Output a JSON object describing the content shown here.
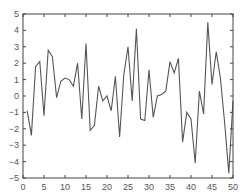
{
  "chart_data": {
    "type": "line",
    "title": "",
    "xlabel": "",
    "ylabel": "",
    "xlim": [
      0,
      50
    ],
    "ylim": [
      -5,
      5
    ],
    "grid": false,
    "legend": null,
    "x_ticks": [
      0,
      5,
      10,
      15,
      20,
      25,
      30,
      35,
      40,
      45,
      50
    ],
    "y_ticks": [
      -5,
      -4,
      -3,
      -2,
      -1,
      0,
      1,
      2,
      3,
      4,
      5
    ],
    "x_tick_labels": [
      "0",
      "5",
      "10",
      "15",
      "20",
      "25",
      "30",
      "35",
      "40",
      "45",
      "50"
    ],
    "y_tick_labels": [
      "−5",
      "−4",
      "−3",
      "−2",
      "−1",
      "0",
      "1",
      "2",
      "3",
      "4",
      "5"
    ],
    "series": [
      {
        "name": "series-1",
        "color": "#555555",
        "x": [
          1,
          2,
          3,
          4,
          5,
          6,
          7,
          8,
          9,
          10,
          11,
          12,
          13,
          14,
          15,
          16,
          17,
          18,
          19,
          20,
          21,
          22,
          23,
          24,
          25,
          26,
          27,
          28,
          29,
          30,
          31,
          32,
          33,
          34,
          35,
          36,
          37,
          38,
          39,
          40,
          41,
          42,
          43,
          44,
          45,
          46,
          47,
          48,
          49,
          50
        ],
        "values": [
          -0.9,
          -2.4,
          1.8,
          2.1,
          -1.2,
          2.8,
          2.4,
          -0.1,
          0.9,
          1.1,
          1.0,
          0.6,
          2.0,
          -1.4,
          3.2,
          -2.1,
          -1.8,
          0.6,
          -0.3,
          0.0,
          -0.9,
          1.2,
          -2.5,
          1.3,
          3.0,
          -0.3,
          4.1,
          -1.4,
          -1.5,
          1.6,
          -1.3,
          0.0,
          0.1,
          0.3,
          2.1,
          1.4,
          2.3,
          -2.8,
          -1.0,
          -1.4,
          -4.1,
          0.3,
          -1.1,
          4.5,
          0.7,
          2.7,
          1.1,
          -1.6,
          -4.7,
          -0.3
        ]
      }
    ]
  },
  "style": {
    "axis_color": "#444444",
    "line_color": "#555555",
    "background": "#ffffff"
  }
}
